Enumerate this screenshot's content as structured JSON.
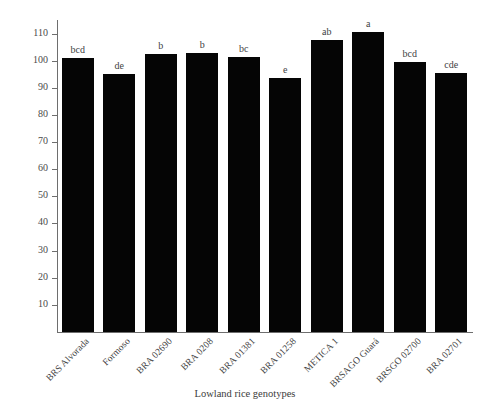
{
  "chart_data": {
    "type": "bar",
    "title": "",
    "xlabel": "Lowland rice genotypes",
    "ylabel": "Plant height (cm)",
    "ylim": [
      0,
      115
    ],
    "ytick_values": [
      10,
      20,
      30,
      40,
      50,
      60,
      70,
      80,
      90,
      100,
      110
    ],
    "ytick_labels": [
      "10",
      "20",
      "30",
      "40",
      "50",
      "60",
      "70",
      "80",
      "90",
      "100",
      "110"
    ],
    "grid": false,
    "legend": null,
    "bar_color": "#050505",
    "axis_color": "#6e6e6e",
    "categories": [
      "BRS Alvorada",
      "Formoso",
      "BRA 02690",
      "BRA 0208",
      "BRA 01381",
      "BRA 01258",
      "METICA 1",
      "BRSAGO Guará",
      "BRSGO 02700",
      "BRA 02701"
    ],
    "values": [
      101.0,
      95.0,
      102.5,
      102.7,
      101.5,
      93.5,
      107.5,
      110.5,
      99.5,
      95.5
    ],
    "annotations": [
      "bcd",
      "de",
      "b",
      "b",
      "bc",
      "e",
      "ab",
      "a",
      "bcd",
      "cde"
    ]
  }
}
